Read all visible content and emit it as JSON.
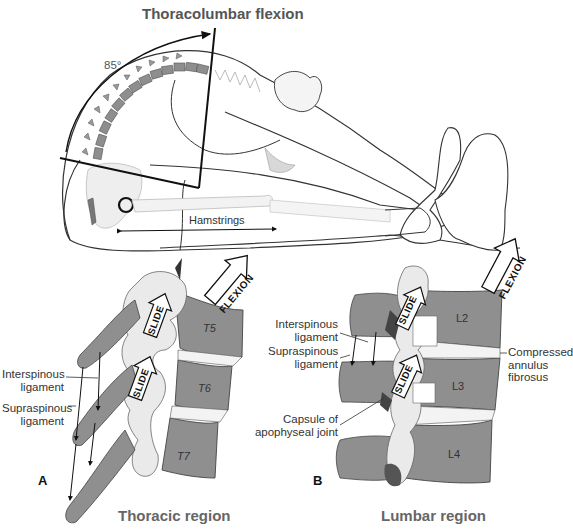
{
  "figure": {
    "title": "Thoracolumbar flexion",
    "angle_label": "85°",
    "hamstrings_label": "Hamstrings"
  },
  "panel_a": {
    "letter": "A",
    "region_title": "Thoracic region",
    "vertebrae": [
      "T5",
      "T6",
      "T7"
    ],
    "arrows": {
      "flexion": "FLEXION",
      "slide_upper": "SLIDE",
      "slide_lower": "SLIDE"
    },
    "labels": {
      "interspinous_line1": "Interspinous",
      "interspinous_line2": "ligament",
      "supraspinous_line1": "Supraspinous",
      "supraspinous_line2": "ligament"
    }
  },
  "panel_b": {
    "letter": "B",
    "region_title": "Lumbar region",
    "vertebrae": [
      "L2",
      "L3",
      "L4"
    ],
    "arrows": {
      "flexion": "FLEXION",
      "slide_upper": "SLIDE",
      "slide_lower": "SLIDE"
    },
    "labels": {
      "interspinous_line1": "Interspinous",
      "interspinous_line2": "ligament",
      "supraspinous_line1": "Supraspinous",
      "supraspinous_line2": "ligament",
      "capsule_line1": "Capsule of",
      "capsule_line2": "apophyseal joint",
      "annulus_line1": "Compressed",
      "annulus_line2": "annulus",
      "annulus_line3": "fibrosus"
    }
  },
  "colors": {
    "bone_dark": "#8c8c8c",
    "bone_light": "#e6e6e6",
    "outline": "#222222",
    "text": "#333333",
    "title_text": "#555555"
  }
}
